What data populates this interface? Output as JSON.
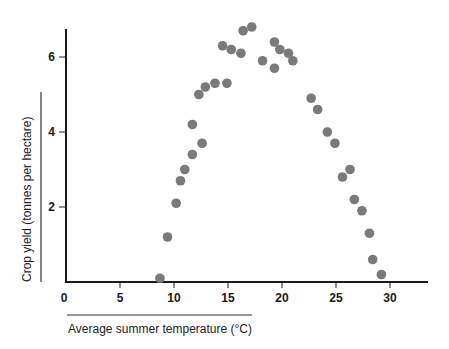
{
  "chart_data": {
    "type": "scatter",
    "title": "",
    "xlabel": "Average summer temperature (°C)",
    "ylabel": "Crop yield (tonnes per hectare)",
    "xlim": [
      0,
      33
    ],
    "ylim": [
      0,
      7
    ],
    "x_ticks": [
      0,
      5,
      10,
      15,
      20,
      25,
      30
    ],
    "y_ticks": [
      2,
      4,
      6
    ],
    "grid": false,
    "legend": null,
    "marker_color": "#7a7a7a",
    "series": [
      {
        "name": "crop yield",
        "points": [
          {
            "x": 8.7,
            "y": 0.1
          },
          {
            "x": 9.4,
            "y": 1.2
          },
          {
            "x": 10.2,
            "y": 2.1
          },
          {
            "x": 10.6,
            "y": 2.7
          },
          {
            "x": 11.0,
            "y": 3.0
          },
          {
            "x": 11.7,
            "y": 3.4
          },
          {
            "x": 11.7,
            "y": 4.2
          },
          {
            "x": 12.6,
            "y": 3.7
          },
          {
            "x": 12.3,
            "y": 5.0
          },
          {
            "x": 12.9,
            "y": 5.2
          },
          {
            "x": 13.8,
            "y": 5.3
          },
          {
            "x": 14.9,
            "y": 5.3
          },
          {
            "x": 14.5,
            "y": 6.3
          },
          {
            "x": 15.3,
            "y": 6.2
          },
          {
            "x": 16.2,
            "y": 6.1
          },
          {
            "x": 16.4,
            "y": 6.7
          },
          {
            "x": 17.2,
            "y": 6.8
          },
          {
            "x": 18.2,
            "y": 5.9
          },
          {
            "x": 19.3,
            "y": 6.4
          },
          {
            "x": 19.3,
            "y": 5.7
          },
          {
            "x": 19.8,
            "y": 6.2
          },
          {
            "x": 20.6,
            "y": 6.1
          },
          {
            "x": 21.0,
            "y": 5.9
          },
          {
            "x": 22.7,
            "y": 4.9
          },
          {
            "x": 23.3,
            "y": 4.6
          },
          {
            "x": 24.2,
            "y": 4.0
          },
          {
            "x": 24.9,
            "y": 3.7
          },
          {
            "x": 26.3,
            "y": 3.0
          },
          {
            "x": 25.6,
            "y": 2.8
          },
          {
            "x": 26.7,
            "y": 2.2
          },
          {
            "x": 27.4,
            "y": 1.9
          },
          {
            "x": 28.1,
            "y": 1.3
          },
          {
            "x": 28.4,
            "y": 0.6
          },
          {
            "x": 29.2,
            "y": 0.2
          }
        ]
      }
    ]
  }
}
